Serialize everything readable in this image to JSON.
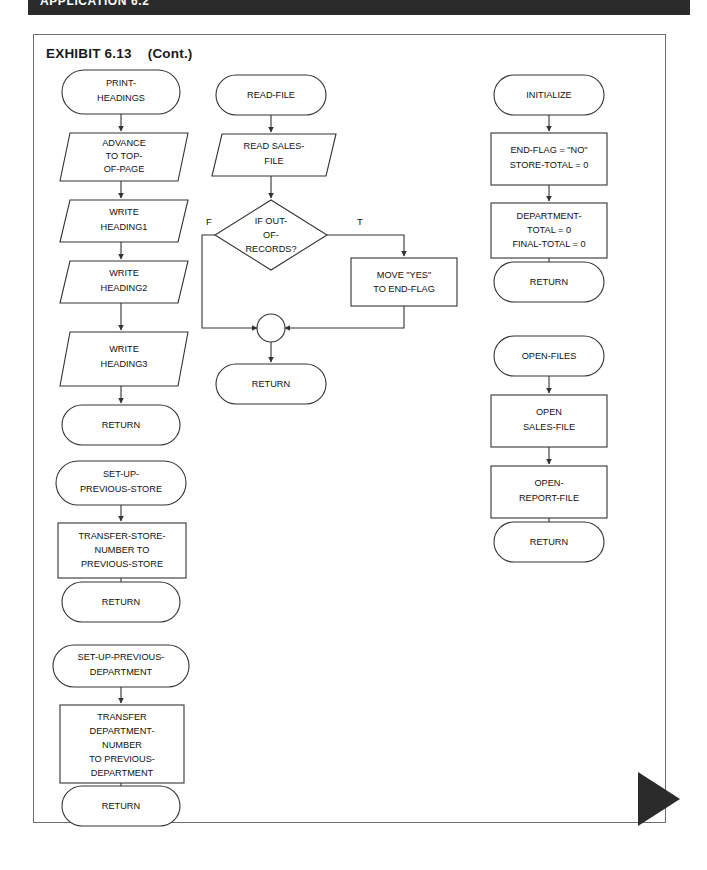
{
  "header": {
    "banner_title": "APPLICATION 6.2"
  },
  "exhibit": {
    "title": "EXHIBIT 6.13",
    "continuation": "(Cont.)"
  },
  "diagram": {
    "type": "flowchart",
    "columns": [
      {
        "name": "left-column",
        "modules": [
          {
            "name": "print-headings-module",
            "nodes": [
              {
                "id": "print-headings",
                "shape": "terminal",
                "lines": [
                  "PRINT-",
                  "HEADINGS"
                ]
              },
              {
                "id": "advance-to-top-of-page",
                "shape": "io-parallelogram",
                "lines": [
                  "ADVANCE",
                  "TO TOP-",
                  "OF-PAGE"
                ]
              },
              {
                "id": "write-heading1",
                "shape": "io-parallelogram",
                "lines": [
                  "WRITE",
                  "HEADING1"
                ]
              },
              {
                "id": "write-heading2",
                "shape": "io-parallelogram",
                "lines": [
                  "WRITE",
                  "HEADING2"
                ]
              },
              {
                "id": "write-heading3",
                "shape": "io-parallelogram",
                "lines": [
                  "WRITE",
                  "HEADING3"
                ]
              },
              {
                "id": "return-1",
                "shape": "terminal",
                "lines": [
                  "RETURN"
                ]
              }
            ]
          },
          {
            "name": "set-up-previous-store-module",
            "nodes": [
              {
                "id": "set-up-previous-store",
                "shape": "terminal",
                "lines": [
                  "SET-UP-",
                  "PREVIOUS-STORE"
                ]
              },
              {
                "id": "transfer-store-number",
                "shape": "process",
                "lines": [
                  "TRANSFER-STORE-",
                  "NUMBER TO",
                  "PREVIOUS-STORE"
                ]
              },
              {
                "id": "return-2",
                "shape": "terminal",
                "lines": [
                  "RETURN"
                ]
              }
            ]
          },
          {
            "name": "set-up-previous-department-module",
            "nodes": [
              {
                "id": "set-up-previous-department",
                "shape": "terminal",
                "lines": [
                  "SET-UP-PREVIOUS-",
                  "DEPARTMENT"
                ]
              },
              {
                "id": "transfer-department-number",
                "shape": "process",
                "lines": [
                  "TRANSFER",
                  "DEPARTMENT-",
                  "NUMBER",
                  "TO PREVIOUS-",
                  "DEPARTMENT"
                ]
              },
              {
                "id": "return-3",
                "shape": "terminal",
                "lines": [
                  "RETURN"
                ]
              }
            ]
          }
        ]
      },
      {
        "name": "middle-column",
        "modules": [
          {
            "name": "read-file-module",
            "nodes": [
              {
                "id": "read-file",
                "shape": "terminal",
                "lines": [
                  "READ-FILE"
                ]
              },
              {
                "id": "read-sales-file",
                "shape": "io-parallelogram",
                "lines": [
                  "READ SALES-",
                  "FILE"
                ]
              },
              {
                "id": "if-out-of-records",
                "shape": "decision",
                "lines": [
                  "IF OUT-",
                  "OF-",
                  "RECORDS?"
                ]
              },
              {
                "id": "move-yes-to-end-flag",
                "shape": "process",
                "lines": [
                  "MOVE \"YES\"",
                  "TO END-FLAG"
                ]
              },
              {
                "id": "junction-connector",
                "shape": "connector",
                "lines": []
              },
              {
                "id": "return-4",
                "shape": "terminal",
                "lines": [
                  "RETURN"
                ]
              }
            ],
            "branch_labels": {
              "false": "F",
              "true": "T"
            }
          }
        ]
      },
      {
        "name": "right-column",
        "modules": [
          {
            "name": "initialize-module",
            "nodes": [
              {
                "id": "initialize",
                "shape": "terminal",
                "lines": [
                  "INITIALIZE"
                ]
              },
              {
                "id": "end-flag-store-total",
                "shape": "process",
                "lines": [
                  "END-FLAG = \"NO\"",
                  "STORE-TOTAL = 0"
                ]
              },
              {
                "id": "department-final-total",
                "shape": "process",
                "lines": [
                  "DEPARTMENT-",
                  "TOTAL = 0",
                  "FINAL-TOTAL = 0"
                ]
              },
              {
                "id": "return-5",
                "shape": "terminal",
                "lines": [
                  "RETURN"
                ]
              }
            ]
          },
          {
            "name": "open-files-module",
            "nodes": [
              {
                "id": "open-files",
                "shape": "terminal",
                "lines": [
                  "OPEN-FILES"
                ]
              },
              {
                "id": "open-sales-file",
                "shape": "process",
                "lines": [
                  "OPEN",
                  "SALES-FILE"
                ]
              },
              {
                "id": "open-report-file",
                "shape": "process",
                "lines": [
                  "OPEN-",
                  "REPORT-FILE"
                ]
              },
              {
                "id": "return-6",
                "shape": "terminal",
                "lines": [
                  "RETURN"
                ]
              }
            ]
          }
        ]
      }
    ]
  },
  "colors": {
    "banner": "#2b2b2b",
    "frame_border": "#6e6e6e",
    "stroke": "#333333",
    "text": "#111111",
    "page_background": "#ffffff"
  }
}
